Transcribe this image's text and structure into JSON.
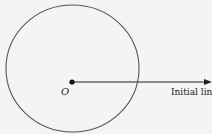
{
  "diagram": {
    "type": "polar-coordinates",
    "pole_label": "O",
    "initial_line_label": "Initial lin",
    "colors": {
      "background": "#f4f4f4",
      "stroke": "#555555",
      "text": "#222222"
    }
  }
}
